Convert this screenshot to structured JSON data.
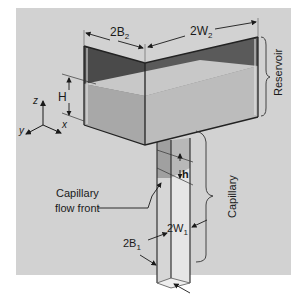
{
  "diagram": {
    "title": "",
    "labels": {
      "reservoir_depth": "2B",
      "reservoir_depth_sub": "2",
      "reservoir_width": "2W",
      "reservoir_width_sub": "2",
      "reservoir": "Reservoir",
      "fluid_height": "H",
      "capillary_rise": "h",
      "capillary": "Capillary",
      "flow_front_line1": "Capillary",
      "flow_front_line2": "flow front",
      "capillary_width": "2W",
      "capillary_width_sub": "1",
      "capillary_depth": "2B",
      "capillary_depth_sub": "1"
    },
    "axes": {
      "z": "z",
      "y": "y",
      "x": "x"
    },
    "colors": {
      "background": "#d2d2d2",
      "reservoir_top_dark": "#555555",
      "reservoir_fluid_left": "#a8a8a8",
      "reservoir_fluid_front": "#bcbcbc",
      "capillary_left": "#c4c4c4",
      "capillary_right": "#e2e2e2",
      "lines": "#1a1a1a"
    }
  }
}
